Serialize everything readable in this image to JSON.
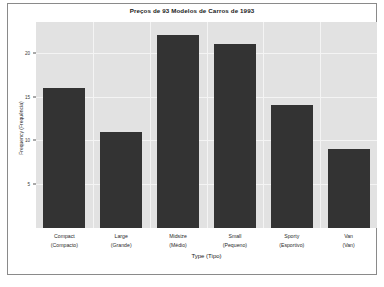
{
  "chart_data": {
    "type": "bar",
    "title": "Preços de 93 Modelos de Carros de 1993",
    "xlabel": "Type (Tipo)",
    "ylabel": "Frequency (Frequência)",
    "categories": [
      "Compact",
      "Large",
      "Midsize",
      "Small",
      "Sporty",
      "Van"
    ],
    "categories_pt": [
      "(Compacto)",
      "(Grande)",
      "(Médio)",
      "(Pequeno)",
      "(Esportivo)",
      "(Van)"
    ],
    "values": [
      16,
      11,
      22,
      21,
      14,
      9
    ],
    "ylim": [
      0,
      23.5
    ],
    "yticks": [
      5,
      10,
      15,
      20
    ],
    "ytick_labels": [
      "5",
      "10",
      "15",
      "20"
    ],
    "grid": true,
    "legend": "none",
    "bar_color": "#333333",
    "panel_color": "#e2e2e2",
    "grid_color": "#f4f4f4"
  }
}
